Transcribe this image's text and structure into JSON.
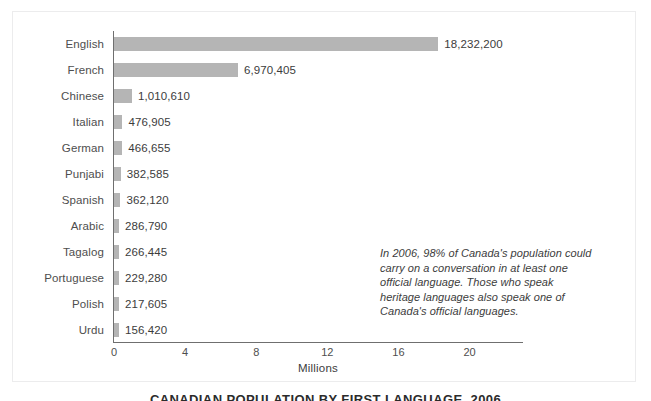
{
  "figure": {
    "caption": "CANADIAN POPULATION BY FIRST LANGUAGE, 2006",
    "annotation": "In 2006, 98% of Canada's population could carry on a conversation in at least one official language. Those who speak heritage languages also speak one of Canada's official languages.",
    "colors": {
      "bar": "#b5b5b5",
      "axis": "#6f6f6f",
      "label_text": "#4e4e4e",
      "value_text": "#3c3c3c",
      "frame": "#ececed",
      "background": "#ffffff"
    }
  },
  "chart_data": {
    "type": "bar",
    "orientation": "horizontal",
    "title": "CANADIAN POPULATION BY FIRST LANGUAGE, 2006",
    "xlabel": "Millions",
    "ylabel": "",
    "xlim": [
      0,
      23.1
    ],
    "xticks": [
      0,
      4,
      8,
      12,
      16,
      20
    ],
    "xtick_labels": [
      "0",
      "4",
      "8",
      "12",
      "16",
      "20"
    ],
    "grid": false,
    "legend": false,
    "units": "people",
    "categories": [
      "English",
      "French",
      "Chinese",
      "Italian",
      "German",
      "Punjabi",
      "Spanish",
      "Arabic",
      "Tagalog",
      "Portuguese",
      "Polish",
      "Urdu"
    ],
    "values": [
      18232200,
      6970405,
      1010610,
      476905,
      466655,
      382585,
      362120,
      286790,
      266445,
      229280,
      217605,
      156420
    ],
    "value_labels": [
      "18,232,200",
      "6,970,405",
      "1,010,610",
      "476,905",
      "466,655",
      "382,585",
      "362,120",
      "286,790",
      "266,445",
      "229,280",
      "217,605",
      "156,420"
    ],
    "annotation": "In 2006, 98% of Canada's population could carry on a conversation in at least one official language. Those who speak heritage languages also speak one of Canada's official languages."
  }
}
